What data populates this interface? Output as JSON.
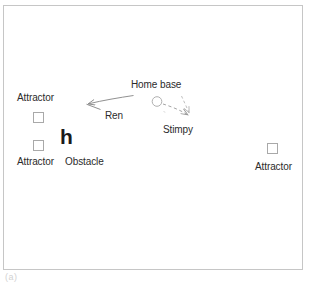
{
  "figure": {
    "caption": "(a)",
    "background_color": "#ffffff",
    "frame_color": "#c6c6c6",
    "label_color": "#2b2b2b"
  },
  "arena": {
    "frame": {
      "x": 3,
      "y": 5,
      "width": 300,
      "height": 265
    }
  },
  "labels": {
    "attractor_top_left": "Attractor",
    "attractor_bottom_left": "Attractor",
    "attractor_right": "Attractor",
    "obstacle": "Obstacle",
    "home_base": "Home base",
    "ren": "Ren",
    "stimpy": "Stimpy"
  },
  "diagram_elements": {
    "attractors": [
      {
        "name": "attractor-upper-left",
        "x": 33,
        "y": 112,
        "size": 11,
        "stroke": "#a9a9a9"
      },
      {
        "name": "attractor-lower-left",
        "x": 33,
        "y": 140,
        "size": 11,
        "stroke": "#a9a9a9"
      },
      {
        "name": "attractor-right",
        "x": 267,
        "y": 143,
        "size": 11,
        "stroke": "#a9a9a9"
      }
    ],
    "obstacle": {
      "glyph": "h",
      "x": 60,
      "y": 128,
      "color": "#1a1a1a"
    },
    "home_base": {
      "shape": "circle",
      "cx": 157,
      "cy": 102,
      "r": 5,
      "stroke": "#b0b0b0"
    },
    "trajectories": [
      {
        "agent": "Ren",
        "style": "solid",
        "color": "#8a8a8a",
        "from": [
          133,
          96
        ],
        "to": [
          86,
          104
        ],
        "arrowhead": "at-end"
      },
      {
        "agent": "Stimpy",
        "style": "dashed",
        "color": "#a0a0a0",
        "from": [
          163,
          104
        ],
        "to": [
          189,
          116
        ],
        "arrowhead": "at-end"
      },
      {
        "agent": "Stimpy",
        "style": "dashed-secondary",
        "color": "#b4b4b4",
        "from": [
          182,
          96
        ],
        "to": [
          190,
          113
        ],
        "arrowhead": "at-end"
      }
    ]
  }
}
